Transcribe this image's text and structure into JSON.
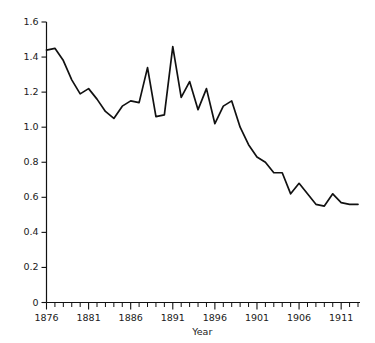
{
  "chart_data": {
    "type": "line",
    "title": "",
    "xlabel": "Year",
    "ylabel": "",
    "xlim": [
      1876,
      1913
    ],
    "ylim": [
      0,
      1.6
    ],
    "grid": false,
    "legend": null,
    "y_ticks": [
      "0",
      "0.2",
      "0.4",
      "0.6",
      "0.8",
      "1.0",
      "1.2",
      "1.4",
      "1.6"
    ],
    "y_tick_values": [
      0,
      0.2,
      0.4,
      0.6,
      0.8,
      1.0,
      1.2,
      1.4,
      1.6
    ],
    "x_ticks": [
      "1876",
      "1881",
      "1886",
      "1891",
      "1896",
      "1901",
      "1906",
      "1911"
    ],
    "x_tick_values": [
      1876,
      1881,
      1886,
      1891,
      1896,
      1901,
      1906,
      1911
    ],
    "x_minor_tick_step": 1,
    "line_color": "#111111",
    "x": [
      1876,
      1877,
      1878,
      1879,
      1880,
      1881,
      1882,
      1883,
      1884,
      1885,
      1886,
      1887,
      1888,
      1889,
      1890,
      1891,
      1892,
      1893,
      1894,
      1895,
      1896,
      1897,
      1898,
      1899,
      1900,
      1901,
      1902,
      1903,
      1904,
      1905,
      1906,
      1907,
      1908,
      1909,
      1910,
      1911,
      1912,
      1913
    ],
    "values": [
      1.44,
      1.45,
      1.38,
      1.27,
      1.19,
      1.22,
      1.16,
      1.09,
      1.05,
      1.12,
      1.15,
      1.14,
      1.34,
      1.06,
      1.07,
      1.46,
      1.17,
      1.26,
      1.1,
      1.22,
      1.02,
      1.12,
      1.15,
      1.0,
      0.9,
      0.83,
      0.8,
      0.74,
      0.74,
      0.62,
      0.68,
      0.62,
      0.56,
      0.55,
      0.62,
      0.57,
      0.56,
      0.56
    ],
    "series": [
      {
        "name": "series-1",
        "values": [
          1.44,
          1.45,
          1.38,
          1.27,
          1.19,
          1.22,
          1.16,
          1.09,
          1.05,
          1.12,
          1.15,
          1.14,
          1.34,
          1.06,
          1.07,
          1.46,
          1.17,
          1.26,
          1.1,
          1.22,
          1.02,
          1.12,
          1.15,
          1.0,
          0.9,
          0.83,
          0.8,
          0.74,
          0.74,
          0.62,
          0.68,
          0.62,
          0.56,
          0.55,
          0.62,
          0.57,
          0.56,
          0.56
        ]
      }
    ]
  }
}
